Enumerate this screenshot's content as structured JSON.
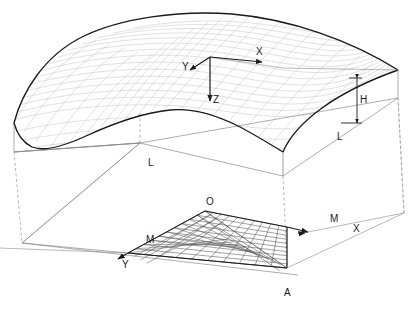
{
  "figure": {
    "type": "engineering-line-drawing",
    "background_color": "#ffffff",
    "line_color": "#1a1a1a",
    "mesh_color": "#b8b8b8",
    "thin_line_color": "#8a8a8a",
    "dashed_line_color": "#9a9a9a"
  },
  "labels": {
    "axis_x_shell": "X",
    "axis_y_shell": "Y",
    "axis_z_shell": "Z",
    "height_h": "H",
    "span_l_front": "L",
    "span_l_right": "L",
    "origin_o": "O",
    "mesh_m_left": "M",
    "mesh_m_right": "M",
    "axis_x_plan": "X",
    "axis_y_plan": "Y",
    "point_a": "A"
  },
  "chart_data": {
    "type": "line",
    "mesh_divisions": {
      "u": 10,
      "v": 10
    }
  }
}
